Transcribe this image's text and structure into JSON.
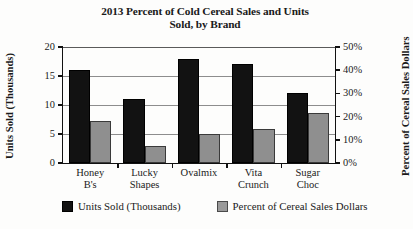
{
  "chart_data": {
    "type": "bar",
    "title": "2013 Percent of Cold Cereal Sales and Units Sold, by Brand",
    "title_line1": "2013 Percent of Cold Cereal Sales and Units",
    "title_line2": "Sold, by Brand",
    "xlabel": "",
    "ylabel": "Units Sold (Thousands)",
    "y2label": "Percent of Cereal Sales Dollars",
    "categories": [
      "Honey B's",
      "Lucky Shapes",
      "Ovalmix",
      "Vita Crunch",
      "Sugar Choc"
    ],
    "categories_lines": [
      [
        "Honey",
        "B's"
      ],
      [
        "Lucky",
        "Shapes"
      ],
      [
        "Ovalmix",
        ""
      ],
      [
        "Vita",
        "Crunch"
      ],
      [
        "Sugar",
        "Choc"
      ]
    ],
    "series": [
      {
        "name": "Units Sold (Thousands)",
        "axis": "left",
        "color": "#121212",
        "values": [
          16,
          11,
          18,
          17,
          12
        ]
      },
      {
        "name": "Percent of Cereal Sales Dollars",
        "axis": "right",
        "color": "#8f8f8f",
        "values": [
          18,
          7.5,
          12.5,
          14.5,
          21.5
        ]
      }
    ],
    "ylim": [
      0,
      20
    ],
    "yticks": [
      0,
      5,
      10,
      15,
      20
    ],
    "ytick_labels": [
      "0",
      "5",
      "10",
      "15",
      "20"
    ],
    "y2lim": [
      0,
      50
    ],
    "y2ticks": [
      0,
      10,
      20,
      30,
      40,
      50
    ],
    "y2tick_labels": [
      "0%",
      "10%",
      "20%",
      "30%",
      "40%",
      "50%"
    ],
    "grid": true,
    "legend_position": "bottom"
  },
  "legend": {
    "items": [
      {
        "label": "Units Sold (Thousands)",
        "color": "#121212"
      },
      {
        "label": "Percent of Cereal Sales Dollars",
        "color": "#9a9a9a"
      }
    ]
  }
}
